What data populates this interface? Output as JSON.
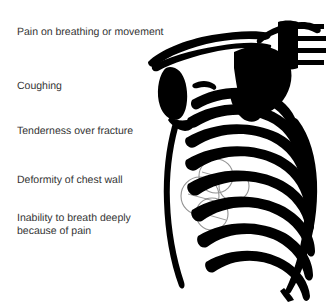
{
  "slide": {
    "title": "RIB FRACTURE",
    "background_color": "#ffffff",
    "text_color": "#333333",
    "ink_color": "#000000",
    "width": 328,
    "height": 304
  },
  "symptoms": [
    {
      "id": "pain-on-breathing",
      "label": "Pain on breathing or movement"
    },
    {
      "id": "coughing",
      "label": "Coughing"
    },
    {
      "id": "tenderness",
      "label": "Tenderness over fracture"
    },
    {
      "id": "deformity",
      "label": "Deformity of chest wall"
    },
    {
      "id": "inability-to-breath",
      "label": "Inability to breath deeply\nbecause of pain"
    }
  ],
  "illustration": {
    "name": "rib-cage-diagram",
    "style": "black-and-white line art",
    "view": "oblique lateral",
    "parts": [
      {
        "id": "clavicle",
        "label": "Clavicle"
      },
      {
        "id": "sternum",
        "label": "Sternum"
      },
      {
        "id": "scapula",
        "label": "Scapula"
      },
      {
        "id": "cervical-vertebrae",
        "label": "Cervical vertebrae"
      },
      {
        "id": "ribs",
        "label": "Ribs"
      },
      {
        "id": "fracture-markers",
        "label": "Fracture site markers"
      }
    ],
    "fracture_marker_count": 4
  }
}
